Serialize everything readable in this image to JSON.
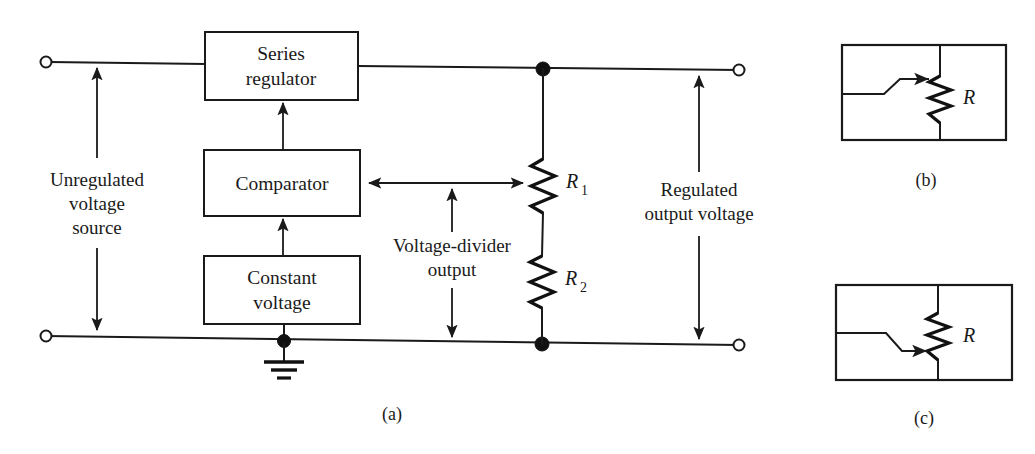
{
  "figure": {
    "background_color": "#ffffff",
    "line_color": "#1a1a1a"
  },
  "panel_a": {
    "caption": "(a)",
    "blocks": [
      {
        "id": "series-regulator",
        "label_line1": "Series",
        "label_line2": "regulator"
      },
      {
        "id": "comparator",
        "label_line1": "Comparator",
        "label_line2": ""
      },
      {
        "id": "constant-voltage",
        "label_line1": "Constant",
        "label_line2": "voltage"
      }
    ],
    "annotations": [
      {
        "id": "input-source",
        "line1": "Unregulated",
        "line2": "voltage",
        "line3": "source"
      },
      {
        "id": "divider-output",
        "line1": "Voltage-divider",
        "line2": "output",
        "line3": ""
      },
      {
        "id": "output-voltage",
        "line1": "Regulated",
        "line2": "output voltage",
        "line3": ""
      }
    ],
    "resistors": [
      {
        "id": "r1",
        "symbol": "R",
        "subscript": "1"
      },
      {
        "id": "r2",
        "symbol": "R",
        "subscript": "2"
      }
    ],
    "ground_symbol": "earth-ground"
  },
  "panel_b": {
    "caption": "(b)",
    "resistor_label": "R",
    "resistor_subscript": "",
    "wiper": "top-tap-rheostat"
  },
  "panel_c": {
    "caption": "(c)",
    "resistor_label": "R",
    "resistor_subscript": "",
    "wiper": "bottom-tap-rheostat"
  }
}
